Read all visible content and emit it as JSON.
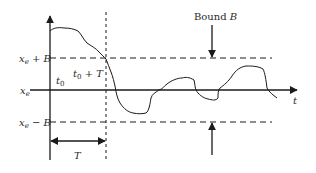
{
  "diagram": {
    "labels": {
      "upper_bound": "x_e + B",
      "center": "x_e",
      "lower_bound": "x_e − B",
      "t0": "t0",
      "t0_plus_T": "t0 + T",
      "bound": "Bound B",
      "time_axis": "t",
      "period": "T"
    },
    "colors": {
      "stroke": "#1a1a1a",
      "text": "#2a2a2a",
      "background": "#ffffff"
    }
  }
}
